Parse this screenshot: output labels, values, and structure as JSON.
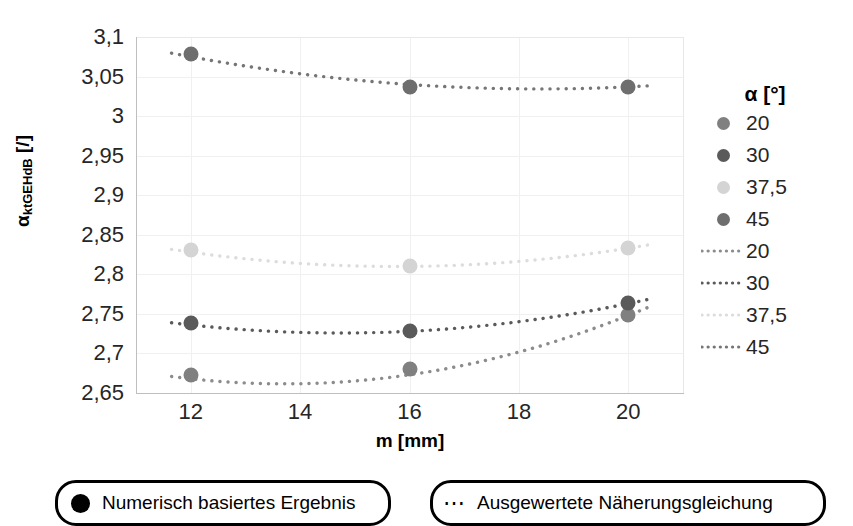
{
  "chart_data": {
    "type": "scatter",
    "title": "",
    "xlabel": "m [mm]",
    "ylabel": "αktGEHdB [/]",
    "ylabel_base": "α",
    "ylabel_sub": "ktGEHdB",
    "ylabel_unit": "[/]",
    "xlim": [
      11,
      21
    ],
    "ylim": [
      2.65,
      3.1
    ],
    "xticks": [
      "12",
      "14",
      "16",
      "18",
      "20"
    ],
    "xtick_values": [
      12,
      14,
      16,
      18,
      20
    ],
    "yticks": [
      "2,65",
      "2,7",
      "2,75",
      "2,8",
      "2,85",
      "2,9",
      "2,95",
      "3",
      "3,05",
      "3,1"
    ],
    "ytick_values": [
      2.65,
      2.7,
      2.75,
      2.8,
      2.85,
      2.9,
      2.95,
      3.0,
      3.05,
      3.1
    ],
    "grid": true,
    "legend_position": "right",
    "x": [
      12,
      16,
      20
    ],
    "series": [
      {
        "name": "20",
        "label": "20",
        "color": "#808080",
        "values": [
          2.673,
          2.68,
          2.748
        ]
      },
      {
        "name": "30",
        "label": "30",
        "color": "#5a5a5a",
        "values": [
          2.739,
          2.729,
          2.764
        ]
      },
      {
        "name": "37,5",
        "label": "37,5",
        "color": "#d4d4d4",
        "values": [
          2.831,
          2.81,
          2.833
        ]
      },
      {
        "name": "45",
        "label": "45",
        "color": "#6e6e6e",
        "values": [
          3.078,
          3.037,
          3.037
        ]
      }
    ],
    "fit_series": [
      {
        "name": "20",
        "label": "20",
        "color": "#8c8c8c",
        "values": [
          2.668,
          2.673,
          2.748
        ]
      },
      {
        "name": "30",
        "label": "30",
        "color": "#5a5a5a",
        "values": [
          2.736,
          2.728,
          2.763
        ]
      },
      {
        "name": "37,5",
        "label": "37,5",
        "color": "#dcdcdc",
        "values": [
          2.828,
          2.81,
          2.833
        ]
      },
      {
        "name": "45",
        "label": "45",
        "color": "#767676",
        "values": [
          3.075,
          3.04,
          3.037
        ]
      }
    ]
  },
  "legend": {
    "title": "α [°]",
    "marker_entries": [
      {
        "label": "20",
        "color": "#808080"
      },
      {
        "label": "30",
        "color": "#5a5a5a"
      },
      {
        "label": "37,5",
        "color": "#d4d4d4"
      },
      {
        "label": "45",
        "color": "#6e6e6e"
      }
    ],
    "line_entries": [
      {
        "label": "20",
        "color": "#8c8c8c"
      },
      {
        "label": "30",
        "color": "#5a5a5a"
      },
      {
        "label": "37,5",
        "color": "#dcdcdc"
      },
      {
        "label": "45",
        "color": "#767676"
      }
    ]
  },
  "captions": [
    {
      "icon": "filled-circle-icon",
      "text": "Numerisch basiertes Ergebnis"
    },
    {
      "icon": "dotted-line-icon",
      "text": "Ausgewertete Näherungsgleichung"
    }
  ],
  "colors": {
    "axis": "#bfbfbf",
    "grid": "#f0f0f0",
    "text": "#262626",
    "box_border": "#000000"
  }
}
